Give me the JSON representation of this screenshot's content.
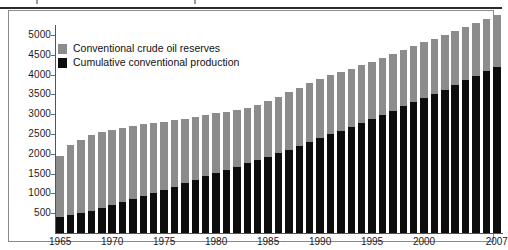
{
  "figure": {
    "frame_color": "#8a8a8a",
    "background": "#ffffff"
  },
  "legend": {
    "position": "top-left inside plot",
    "items": [
      {
        "label": "Conventional crude oil reserves",
        "color": "#8c8c8c",
        "swatch": "reserves-swatch"
      },
      {
        "label": "Cumulative conventional production",
        "color": "#0d0d0d",
        "swatch": "production-swatch"
      }
    ]
  },
  "axes": {
    "y_ticks": [
      "500",
      "1000",
      "1500",
      "2000",
      "2500",
      "3000",
      "3500",
      "4000",
      "4500",
      "5000"
    ],
    "x_ticks": [
      "1965",
      "1970",
      "1975",
      "1980",
      "1985",
      "1990",
      "1995",
      "2000",
      "2007"
    ]
  },
  "chart_data": {
    "type": "bar",
    "stacked": true,
    "title": "",
    "subtitle": "",
    "xlabel": "",
    "ylabel": "",
    "ylim": [
      0,
      5250
    ],
    "ytick_step": 500,
    "grid": false,
    "legend_position": "upper left",
    "categories": [
      "1965",
      "1966",
      "1967",
      "1968",
      "1969",
      "1970",
      "1971",
      "1972",
      "1973",
      "1974",
      "1975",
      "1976",
      "1977",
      "1978",
      "1979",
      "1980",
      "1981",
      "1982",
      "1983",
      "1984",
      "1985",
      "1986",
      "1987",
      "1988",
      "1989",
      "1990",
      "1991",
      "1992",
      "1993",
      "1994",
      "1995",
      "1996",
      "1997",
      "1998",
      "1999",
      "2000",
      "2001",
      "2002",
      "2003",
      "2004",
      "2005",
      "2006",
      "2007"
    ],
    "series": [
      {
        "name": "Cumulative conventional production",
        "color": "#0d0d0d",
        "values": [
          400,
          450,
          500,
          560,
          625,
          700,
          775,
          855,
          940,
          1020,
          1090,
          1170,
          1260,
          1345,
          1440,
          1525,
          1600,
          1675,
          1755,
          1840,
          1925,
          2015,
          2105,
          2200,
          2295,
          2395,
          2490,
          2585,
          2680,
          2780,
          2880,
          2985,
          3090,
          3195,
          3295,
          3405,
          3510,
          3615,
          3730,
          3850,
          3965,
          4085,
          4200
        ]
      },
      {
        "name": "Conventional crude oil reserves",
        "color": "#8c8c8c",
        "values": [
          1550,
          1760,
          1860,
          1910,
          1930,
          1905,
          1880,
          1840,
          1810,
          1755,
          1710,
          1670,
          1630,
          1595,
          1545,
          1500,
          1455,
          1420,
          1405,
          1395,
          1395,
          1420,
          1445,
          1470,
          1485,
          1495,
          1490,
          1485,
          1470,
          1460,
          1445,
          1440,
          1435,
          1430,
          1420,
          1410,
          1395,
          1385,
          1370,
          1355,
          1335,
          1320,
          1305
        ]
      }
    ],
    "totals": [
      1950,
      2210,
      2360,
      2470,
      2555,
      2605,
      2655,
      2695,
      2750,
      2775,
      2800,
      2840,
      2890,
      2940,
      2985,
      3025,
      3055,
      3095,
      3160,
      3235,
      3320,
      3435,
      3550,
      3670,
      3780,
      3890,
      3980,
      4070,
      4150,
      4240,
      4325,
      4425,
      4525,
      4625,
      4715,
      4815,
      4905,
      5000,
      5100,
      5205,
      5300,
      5405,
      5505
    ]
  }
}
